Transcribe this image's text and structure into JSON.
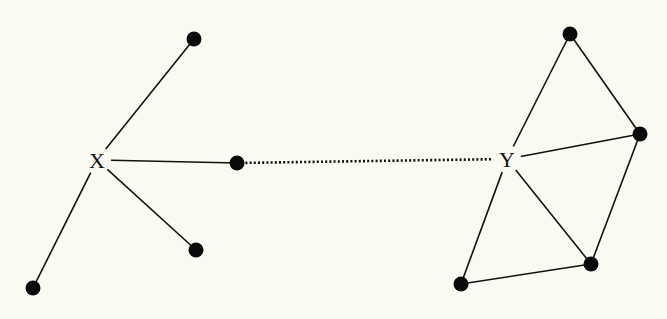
{
  "diagram": {
    "background": "#fbfaf2",
    "ink": "#111111",
    "hubs": [
      {
        "id": "X",
        "label": "X",
        "x": 97,
        "y": 160
      },
      {
        "id": "Y",
        "label": "Y",
        "x": 507,
        "y": 159
      }
    ],
    "nodes": [
      {
        "id": "a1",
        "x": 194,
        "y": 39
      },
      {
        "id": "a2",
        "x": 237,
        "y": 163
      },
      {
        "id": "a3",
        "x": 196,
        "y": 250
      },
      {
        "id": "a4",
        "x": 33,
        "y": 288
      },
      {
        "id": "b1",
        "x": 570,
        "y": 34
      },
      {
        "id": "b2",
        "x": 640,
        "y": 134
      },
      {
        "id": "b3",
        "x": 591,
        "y": 264
      },
      {
        "id": "b4",
        "x": 461,
        "y": 284
      }
    ],
    "edges": [
      {
        "from": "X",
        "to": "a1",
        "style": "solid"
      },
      {
        "from": "X",
        "to": "a2",
        "style": "solid"
      },
      {
        "from": "X",
        "to": "a3",
        "style": "solid"
      },
      {
        "from": "X",
        "to": "a4",
        "style": "solid"
      },
      {
        "from": "Y",
        "to": "b1",
        "style": "solid"
      },
      {
        "from": "Y",
        "to": "b2",
        "style": "solid"
      },
      {
        "from": "Y",
        "to": "b3",
        "style": "solid"
      },
      {
        "from": "Y",
        "to": "b4",
        "style": "solid"
      },
      {
        "from": "b1",
        "to": "b2",
        "style": "solid"
      },
      {
        "from": "b2",
        "to": "b3",
        "style": "solid"
      },
      {
        "from": "b3",
        "to": "b4",
        "style": "solid"
      },
      {
        "from": "a2",
        "to": "Y",
        "style": "dotted"
      }
    ]
  }
}
